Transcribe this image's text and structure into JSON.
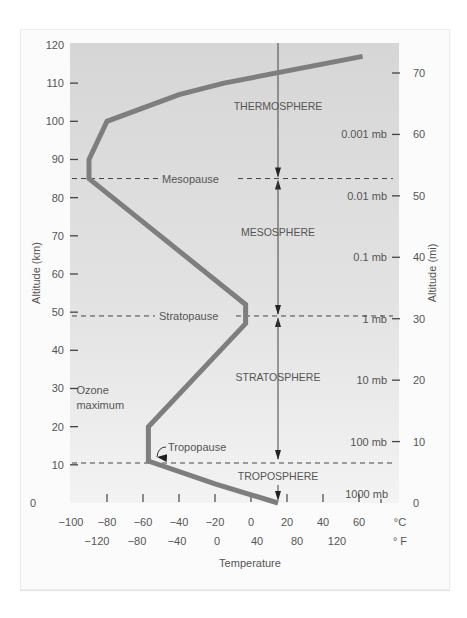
{
  "chart_data": {
    "type": "line",
    "title": "",
    "xlabel": "Temperature",
    "ylabel": "Altitude (km)",
    "ylabel_right": "Altitude (mi)",
    "xlim_c": [
      -100,
      70
    ],
    "ylim_km": [
      0,
      120
    ],
    "grid": false,
    "y_ticks_km": [
      0,
      10,
      20,
      30,
      40,
      50,
      60,
      70,
      80,
      90,
      100,
      110,
      120
    ],
    "x_ticks_c": [
      -100,
      -80,
      -60,
      -40,
      -20,
      0,
      20,
      40,
      60
    ],
    "x_unit_c": "°C",
    "x_ticks_f": [
      -120,
      -80,
      -40,
      0,
      40,
      80,
      120
    ],
    "x_unit_f": "° F",
    "y_ticks_mi": [
      0,
      10,
      20,
      30,
      40,
      50,
      60,
      70
    ],
    "pressure_labels": [
      {
        "label": "1000 mb",
        "km": 0
      },
      {
        "label": "100 mb",
        "km": 16
      },
      {
        "label": "10 mb",
        "km": 32
      },
      {
        "label": "1 mb",
        "km": 48
      },
      {
        "label": "0.1 mb",
        "km": 64
      },
      {
        "label": "0.01 mb",
        "km": 80
      },
      {
        "label": "0.001 mb",
        "km": 96
      }
    ],
    "series": [
      {
        "name": "Temperature profile",
        "points_c_km": [
          [
            15,
            0
          ],
          [
            -20,
            5
          ],
          [
            -57,
            11
          ],
          [
            -57,
            20
          ],
          [
            -3,
            47
          ],
          [
            -3,
            52
          ],
          [
            -90,
            85
          ],
          [
            -90,
            90
          ],
          [
            -80,
            100
          ],
          [
            -40,
            107
          ],
          [
            -15,
            110
          ],
          [
            62,
            117
          ]
        ]
      }
    ],
    "boundaries": [
      {
        "name": "Tropopause",
        "km": 11
      },
      {
        "name": "Stratopause",
        "km": 49
      },
      {
        "name": "Mesopause",
        "km": 85
      }
    ],
    "layers": [
      {
        "name": "TROPOSPHERE",
        "label_km": 6
      },
      {
        "name": "STRATOSPHERE",
        "label_km": 32
      },
      {
        "name": "MESOSPHERE",
        "label_km": 70
      },
      {
        "name": "THERMOSPHERE",
        "label_km": 103
      }
    ],
    "annotations": [
      {
        "text": "Ozone",
        "km": 28.5,
        "c": -97
      },
      {
        "text": "maximum",
        "km": 24.5,
        "c": -97
      }
    ]
  }
}
